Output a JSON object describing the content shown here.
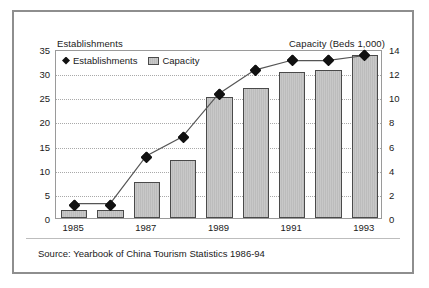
{
  "chart_data": {
    "type": "bar",
    "title": "",
    "subtitle": "",
    "categories": [
      "1985",
      "1986",
      "1987",
      "1988",
      "1989",
      "1990",
      "1991",
      "1992",
      "1993"
    ],
    "x_tick_labels": [
      "1985",
      "1987",
      "1989",
      "1991",
      "1993"
    ],
    "xlabel": "",
    "grid": true,
    "legend_position": "top-left",
    "left_axis": {
      "label": "Establishments",
      "ticks": [
        0,
        5,
        10,
        15,
        20,
        25,
        30,
        35
      ],
      "ylim": [
        0,
        35
      ]
    },
    "right_axis": {
      "label": "Capacity (Beds 1,000)",
      "ticks": [
        0,
        2,
        4,
        6,
        8,
        10,
        12,
        14
      ],
      "ylim": [
        0,
        14
      ]
    },
    "series": [
      {
        "name": "Establishments",
        "type": "line",
        "axis": "left",
        "marker": "diamond",
        "color": "#111111",
        "values": [
          3,
          3,
          13,
          17,
          26,
          31,
          33,
          33,
          34
        ]
      },
      {
        "name": "Capacity",
        "type": "bar",
        "axis": "right",
        "color": "#c2c2c2",
        "values": [
          0.7,
          0.65,
          3.0,
          4.8,
          10.0,
          10.8,
          12.1,
          12.3,
          13.5
        ]
      }
    ],
    "annotations": [
      "Source: Yearbook of China Tourism Statistics 1986-94"
    ]
  },
  "legend": {
    "entries": [
      {
        "label": "Establishments",
        "marker": "diamond-marker"
      },
      {
        "label": "Capacity",
        "marker": "bar-swatch"
      }
    ]
  },
  "labels": {
    "left_axis_title": "Establishments",
    "right_axis_title": "Capacity (Beds 1,000)",
    "source_note": "Source: Yearbook of China Tourism Statistics 1986-94"
  },
  "colors": {
    "bar_fill": "#c2c2c2",
    "bar_stroke": "#4a4a4a",
    "line": "#555555",
    "marker": "#111111",
    "frame": "#8e8e8e",
    "grid": "#a9a9a9",
    "text": "#1a1a1a"
  }
}
